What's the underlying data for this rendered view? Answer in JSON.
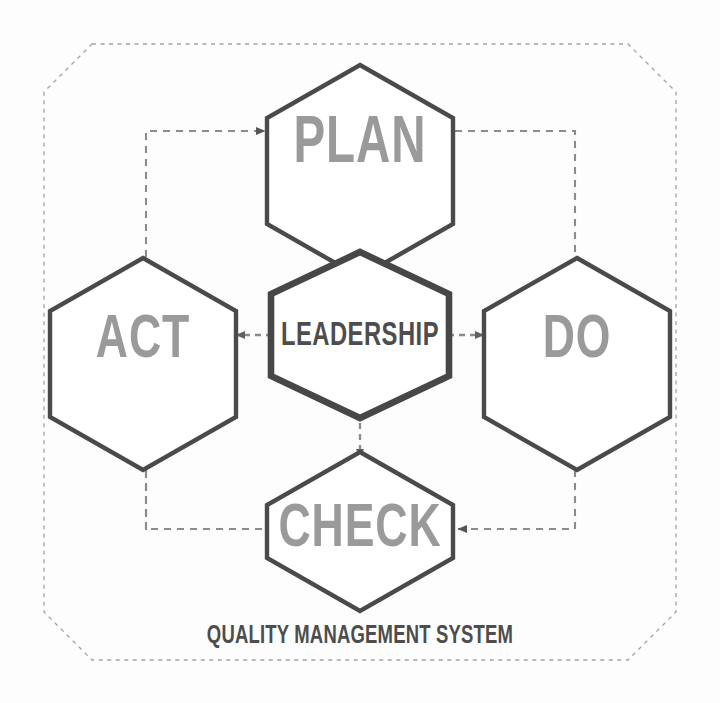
{
  "diagram": {
    "type": "pdca-cycle-hexagon-diagram",
    "caption": "QUALITY MANAGEMENT SYSTEM",
    "center_node": {
      "id": "leadership",
      "label": "LEADERSHIP",
      "shape": "hexagon",
      "border_color": "#4a4a4a",
      "text_color": "#4d4d4d",
      "emphasis": "primary"
    },
    "nodes": [
      {
        "id": "plan",
        "label": "PLAN",
        "shape": "hexagon",
        "position": "top",
        "border_color": "#4a4a4a",
        "text_color": "#9a9a9a"
      },
      {
        "id": "do",
        "label": "DO",
        "shape": "hexagon",
        "position": "right",
        "border_color": "#4a4a4a",
        "text_color": "#9a9a9a"
      },
      {
        "id": "check",
        "label": "CHECK",
        "shape": "hexagon",
        "position": "bottom",
        "border_color": "#4a4a4a",
        "text_color": "#9a9a9a"
      },
      {
        "id": "act",
        "label": "ACT",
        "shape": "hexagon",
        "position": "left",
        "border_color": "#4a4a4a",
        "text_color": "#9a9a9a"
      }
    ],
    "outer_boundary": {
      "id": "quality-management-system-boundary",
      "shape": "octagon",
      "style": "dashed",
      "color": "#9b9b9b"
    },
    "connectors": [
      {
        "id": "act-to-plan",
        "from": "act",
        "to": "plan",
        "style": "dashed",
        "arrow": "to-plan",
        "path": "outer-left"
      },
      {
        "id": "plan-to-do",
        "from": "plan",
        "to": "do",
        "style": "dashed",
        "arrow": "none",
        "path": "outer-right-top"
      },
      {
        "id": "do-to-check",
        "from": "do",
        "to": "check",
        "style": "dashed",
        "arrow": "to-check",
        "path": "outer-right-bottom"
      },
      {
        "id": "check-to-act",
        "from": "check",
        "to": "act",
        "style": "dashed",
        "arrow": "to-act",
        "path": "outer-left-bottom"
      },
      {
        "id": "leadership-to-plan",
        "from": "leadership",
        "to": "plan",
        "style": "dashed",
        "arrow": "up"
      },
      {
        "id": "leadership-to-check",
        "from": "leadership",
        "to": "check",
        "style": "dashed",
        "arrow": "down"
      },
      {
        "id": "leadership-to-act",
        "from": "leadership",
        "to": "act",
        "style": "dashed",
        "arrow": "left"
      },
      {
        "id": "leadership-to-do",
        "from": "leadership",
        "to": "do",
        "style": "dashed",
        "arrow": "right"
      }
    ],
    "colors": {
      "hex_stroke": "#4a4a4a",
      "center_stroke": "#474747",
      "dashed_line": "#8c8c8c",
      "boundary_dash": "#a3a3a3",
      "outer_label_text": "#9a9a9a",
      "center_label_text": "#4d4d4d",
      "caption_text": "#4d4d4d",
      "background": "#fdfdfd"
    }
  }
}
